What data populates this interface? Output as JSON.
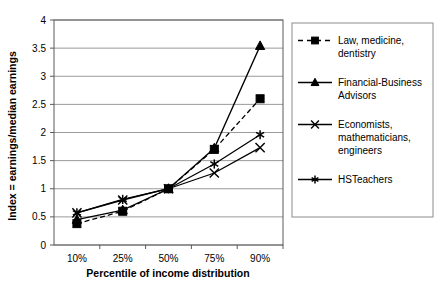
{
  "chart_data": {
    "type": "line",
    "title": "",
    "xlabel": "Percentile of income distribution",
    "ylabel": "Index = earnings/median earnings",
    "categories": [
      "10%",
      "25%",
      "50%",
      "75%",
      "90%"
    ],
    "ylim": [
      0,
      4
    ],
    "ytick_labels": [
      "0",
      "0.5",
      "1",
      "1.5",
      "2",
      "2.5",
      "3",
      "3.5",
      "4"
    ],
    "ytick_values": [
      0,
      0.5,
      1,
      1.5,
      2,
      2.5,
      3,
      3.5,
      4
    ],
    "grid": "horizontal",
    "legend_position": "right",
    "series": [
      {
        "name": "Law, medicine, dentistry",
        "marker": "square",
        "line_style": "dashed",
        "color": "#000000",
        "values": [
          0.38,
          0.6,
          1.0,
          1.7,
          2.6
        ]
      },
      {
        "name": "Financial-Business Advisors",
        "marker": "triangle",
        "line_style": "solid",
        "color": "#000000",
        "values": [
          0.45,
          0.62,
          1.0,
          1.72,
          3.54
        ]
      },
      {
        "name": "Economists, mathematicians, engineers",
        "marker": "x",
        "line_style": "solid",
        "color": "#000000",
        "values": [
          0.57,
          0.8,
          1.0,
          1.28,
          1.73
        ]
      },
      {
        "name": "HSTeachers",
        "marker": "asterisk",
        "line_style": "solid",
        "color": "#000000",
        "values": [
          0.57,
          0.81,
          1.0,
          1.44,
          1.96
        ]
      }
    ]
  },
  "legend": {
    "entries": [
      {
        "label_lines": [
          "Law, medicine,",
          "dentistry"
        ]
      },
      {
        "label_lines": [
          "Financial-Business",
          "Advisors"
        ]
      },
      {
        "label_lines": [
          "Economists,",
          "mathematicians,",
          "engineers"
        ]
      },
      {
        "label_lines": [
          "HSTeachers"
        ]
      }
    ]
  },
  "colors": {
    "ink": "#000000",
    "grid": "#9a9a9a",
    "axis": "#5a5a5a",
    "legend_border": "#8c8c8c",
    "background": "#ffffff"
  }
}
